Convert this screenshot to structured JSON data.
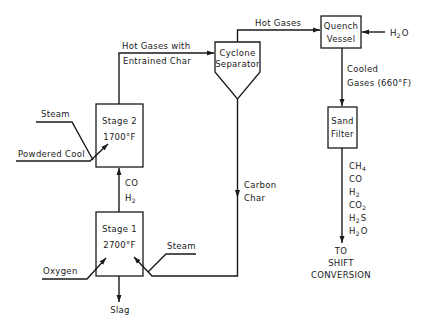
{
  "diagram": {
    "type": "process-flow",
    "units": {
      "stage2": {
        "line1": "Stage 2",
        "line2": "1700°F"
      },
      "stage1": {
        "line1": "Stage 1",
        "line2": "2700°F"
      },
      "cyclone": {
        "line1": "Cyclone",
        "line2": "Separator"
      },
      "quench": {
        "line1": "Quench",
        "line2": "Vessel"
      },
      "filter": {
        "line1": "Sand",
        "line2": "Filter"
      }
    },
    "streams": {
      "hot_gases_char_1": "Hot Gases with",
      "hot_gases_char_2": "Entrained Char",
      "hot_gases": "Hot Gases",
      "water": "H",
      "water_sub": "2",
      "water_o": "O",
      "cooled_1": "Cooled",
      "cooled_2": "Gases (660°F)",
      "steam_top": "Steam",
      "powdered_coal": "Powdered Cool",
      "co": "CO",
      "h2": "H",
      "h2_sub": "2",
      "carbon_1": "Carbon",
      "carbon_2": "Char",
      "steam_bottom": "Steam",
      "oxygen": "Oxygen",
      "slag": "Slag"
    },
    "products": [
      {
        "base": "CH",
        "sub": "4",
        "tail": ""
      },
      {
        "base": "CO",
        "sub": "",
        "tail": ""
      },
      {
        "base": "H",
        "sub": "2",
        "tail": ""
      },
      {
        "base": "CO",
        "sub": "2",
        "tail": ""
      },
      {
        "base": "H",
        "sub": "2",
        "tail": "S"
      },
      {
        "base": "H",
        "sub": "2",
        "tail": "O"
      }
    ],
    "destination": {
      "line1": "TO",
      "line2": "SHIFT",
      "line3": "CONVERSION"
    }
  }
}
